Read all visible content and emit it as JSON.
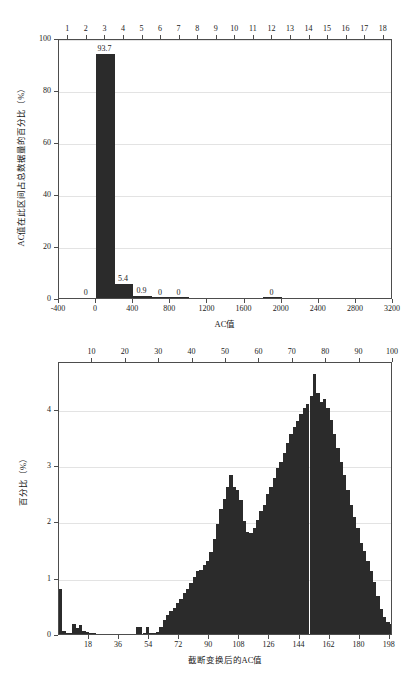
{
  "chart_data": [
    {
      "id": "chart-ac-raw",
      "type": "bar",
      "title": "",
      "xlabel": "AC值",
      "ylabel": "AC值在此区间占总数据量的百分比（%）",
      "xlim": [
        -400,
        3200
      ],
      "ylim": [
        0,
        100
      ],
      "grid": true,
      "x_ticks": [
        "-400",
        "0",
        "400",
        "800",
        "1200",
        "1600",
        "2000",
        "2400",
        "2800",
        "3200"
      ],
      "y_ticks": [
        "0",
        "20",
        "40",
        "60",
        "80",
        "100"
      ],
      "top_axis_ticks": [
        "1",
        "2",
        "3",
        "4",
        "5",
        "6",
        "7",
        "8",
        "9",
        "10",
        "11",
        "12",
        "13",
        "14",
        "15",
        "16",
        "17",
        "18"
      ],
      "bin_width": 200,
      "bin_starts": [
        -400,
        -200,
        0,
        200,
        400,
        600,
        800,
        1000,
        1200,
        1400,
        1600,
        1800,
        2000,
        2200,
        2400,
        2600,
        2800,
        3000
      ],
      "values": [
        0,
        0,
        93.7,
        5.4,
        0.9,
        0.2,
        0.15,
        0.0,
        0.0,
        0.0,
        0.0,
        0.2,
        0.0,
        0.0,
        0.0,
        0.0,
        0.0,
        0.0
      ],
      "data_labels": [
        {
          "x": -100,
          "y": 0.0,
          "text": "0"
        },
        {
          "x": 100,
          "y": 93.7,
          "text": "93.7"
        },
        {
          "x": 300,
          "y": 5.4,
          "text": "5.4"
        },
        {
          "x": 500,
          "y": 0.9,
          "text": "0.9"
        },
        {
          "x": 700,
          "y": 0.2,
          "text": "0"
        },
        {
          "x": 900,
          "y": 0.15,
          "text": "0"
        },
        {
          "x": 1900,
          "y": 0.2,
          "text": "0"
        }
      ]
    },
    {
      "id": "chart-ac-truncated",
      "type": "bar",
      "title": "",
      "xlabel": "截断变换后的AC值",
      "ylabel": "百分比（%）",
      "xlim": [
        0,
        200
      ],
      "ylim": [
        0,
        4.85
      ],
      "grid": true,
      "x_ticks": [
        "18",
        "36",
        "54",
        "72",
        "90",
        "108",
        "126",
        "144",
        "162",
        "180",
        "198"
      ],
      "x_tick_values": [
        18,
        36,
        54,
        72,
        90,
        108,
        126,
        144,
        162,
        180,
        198
      ],
      "y_ticks": [
        "0",
        "1",
        "2",
        "3",
        "4"
      ],
      "top_axis_ticks": [
        "10",
        "20",
        "30",
        "40",
        "50",
        "60",
        "70",
        "80",
        "90",
        "100"
      ],
      "bin_width": 2,
      "bin_centers": [
        1,
        3,
        5,
        7,
        9,
        11,
        13,
        15,
        17,
        19,
        21,
        23,
        25,
        27,
        29,
        31,
        33,
        35,
        37,
        39,
        41,
        43,
        45,
        47,
        49,
        51,
        53,
        55,
        57,
        59,
        61,
        63,
        65,
        67,
        69,
        71,
        73,
        75,
        77,
        79,
        81,
        83,
        85,
        87,
        89,
        91,
        93,
        95,
        97,
        99,
        101,
        103,
        105,
        107,
        109,
        111,
        113,
        115,
        117,
        119,
        121,
        123,
        125,
        127,
        129,
        131,
        133,
        135,
        137,
        139,
        141,
        143,
        145,
        147,
        149,
        151,
        153,
        155,
        157,
        159,
        161,
        163,
        165,
        167,
        169,
        171,
        173,
        175,
        177,
        179,
        181,
        183,
        185,
        187,
        189,
        191,
        193,
        195,
        197,
        199
      ],
      "values": [
        0.8,
        0.05,
        0.02,
        0.01,
        0.18,
        0.1,
        0.16,
        0.05,
        0.03,
        0.01,
        0.01,
        0.0,
        0.0,
        0.0,
        0.0,
        0.0,
        0.0,
        0.0,
        0.0,
        0.0,
        0.0,
        0.0,
        0.0,
        0.12,
        0.12,
        0.02,
        0.12,
        0.02,
        0.02,
        0.04,
        0.12,
        0.25,
        0.33,
        0.4,
        0.47,
        0.55,
        0.62,
        0.72,
        0.8,
        0.9,
        1.02,
        1.12,
        1.13,
        1.22,
        1.3,
        1.45,
        1.68,
        1.95,
        2.22,
        2.4,
        2.62,
        2.82,
        2.62,
        2.55,
        2.38,
        2.0,
        1.82,
        1.8,
        1.88,
        2.02,
        2.18,
        2.3,
        2.48,
        2.62,
        2.78,
        2.95,
        3.05,
        3.22,
        3.4,
        3.55,
        3.68,
        3.78,
        3.9,
        4.02,
        4.08,
        4.22,
        4.62,
        4.28,
        4.12,
        4.18,
        4.02,
        3.8,
        3.55,
        3.3,
        3.05,
        2.82,
        2.55,
        2.3,
        2.08,
        1.88,
        1.62,
        1.48,
        1.3,
        1.12,
        0.92,
        0.68,
        0.45,
        0.3,
        0.22,
        0.18,
        0.14,
        0.1,
        0.08,
        0.06,
        0.05,
        0.04,
        0.03,
        0.03,
        0.02,
        0.02,
        0.02,
        0.02,
        0.02,
        0.02,
        0.02,
        0.03,
        0.04,
        0.06,
        0.1,
        0.18
      ]
    }
  ]
}
